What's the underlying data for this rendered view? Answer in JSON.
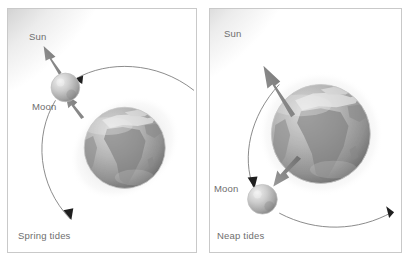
{
  "figure": {
    "background_color": "#ffffff",
    "border_color": "#c9c9c9",
    "label_color": "#6e6e6e",
    "arrow_color": "#8a8a8a",
    "orbit_color": "#7d7d7d"
  },
  "panels": [
    {
      "id": "spring-tides",
      "caption": "Spring tides",
      "sun_label": "Sun",
      "moon_label": "Moon",
      "description_alignment": "aligned",
      "bodies": {
        "sun": {
          "name": "Sun",
          "position": "top-left-corner",
          "rendered": "partial-glow-arc"
        },
        "earth": {
          "name": "Earth",
          "position": "center-right",
          "halo": "elongated-tidal-bulge"
        },
        "moon": {
          "name": "Moon",
          "position": "upper-left-of-earth"
        }
      },
      "force_arrows": [
        {
          "name": "moon-to-sun-pull",
          "direction": "up-left",
          "label": ""
        },
        {
          "name": "earth-to-moon-pull",
          "direction": "up-left",
          "label": ""
        }
      ],
      "orbit": {
        "name": "lunar-orbit-arc",
        "arrowheads": 2
      }
    },
    {
      "id": "neap-tides",
      "caption": "Neap tides",
      "sun_label": "Sun",
      "moon_label": "Moon",
      "description_alignment": "perpendicular",
      "bodies": {
        "sun": {
          "name": "Sun",
          "position": "top-left-corner",
          "rendered": "partial-glow-arc"
        },
        "earth": {
          "name": "Earth",
          "position": "center-right",
          "halo": "circular-tidal-bulge"
        },
        "moon": {
          "name": "Moon",
          "position": "lower-left-of-earth"
        }
      },
      "force_arrows": [
        {
          "name": "earth-to-sun-pull",
          "direction": "up-left",
          "label": ""
        },
        {
          "name": "earth-to-moon-pull",
          "direction": "down-left",
          "label": ""
        }
      ],
      "orbit": {
        "name": "lunar-orbit-arc",
        "arrowheads": 2
      }
    }
  ]
}
